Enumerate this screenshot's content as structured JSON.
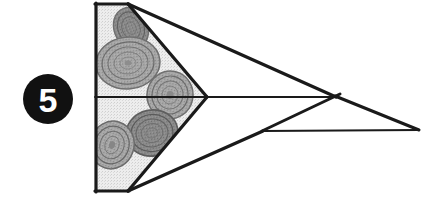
{
  "figure": {
    "caption_number": "5",
    "background_color": "#ffffff",
    "ink_color": "#1a1a1a",
    "shading_color": "#e4e4e4",
    "coin_color": "#9c9c9c",
    "coin_dark_color": "#787878"
  },
  "badge": {
    "label": "5",
    "shape": "filled-circle",
    "fill_color": "#111111",
    "text_color": "#ffffff",
    "center_x": 48,
    "center_y": 99,
    "radius": 25
  },
  "geometry": {
    "shaded_block": {
      "name": "coin-stack-block",
      "left_x": 96,
      "right_x": 128,
      "top_y": 4,
      "bottom_y": 191,
      "mid_y": 97
    },
    "wedge_apex": {
      "x": 206,
      "y": 97
    },
    "upper_wedge_points": "96,4 128,4 206,97 96,97",
    "lower_wedge_points": "96,97 206,97 128,191 96,191",
    "upper_plane_points": "128,4 335,97 206,97",
    "lower_plane_points": "128,191 262,131 335,97",
    "right_tip": {
      "x": 418,
      "y": 130
    },
    "cross_vertex": {
      "x": 335,
      "y": 97
    },
    "lower_ledge_vertex": {
      "x": 262,
      "y": 131
    },
    "spine_line": {
      "x1": 206,
      "y1": 97,
      "x2": 335,
      "y2": 97
    },
    "right_upper_edge": {
      "x1": 335,
      "y1": 97,
      "x2": 418,
      "y2": 130
    },
    "right_lower_edge": {
      "x1": 262,
      "y1": 131,
      "x2": 418,
      "y2": 130
    },
    "stroke_width_heavy": 3.2,
    "stroke_width_light": 1.8
  },
  "coins": [
    {
      "name": "coin-top-right",
      "cx": 131,
      "cy": 28,
      "rx": 17,
      "ry": 21,
      "rot": -22,
      "tone": "dark"
    },
    {
      "name": "coin-upper-large",
      "cx": 128,
      "cy": 63,
      "rx": 32,
      "ry": 26,
      "rot": -6,
      "tone": "mid"
    },
    {
      "name": "coin-apex",
      "cx": 170,
      "cy": 95,
      "rx": 23,
      "ry": 24,
      "rot": 12,
      "tone": "mid"
    },
    {
      "name": "coin-lower-right",
      "cx": 152,
      "cy": 133,
      "rx": 26,
      "ry": 23,
      "rot": -10,
      "tone": "dark"
    },
    {
      "name": "coin-lower-left",
      "cx": 112,
      "cy": 145,
      "rx": 22,
      "ry": 24,
      "rot": 18,
      "tone": "mid"
    }
  ]
}
